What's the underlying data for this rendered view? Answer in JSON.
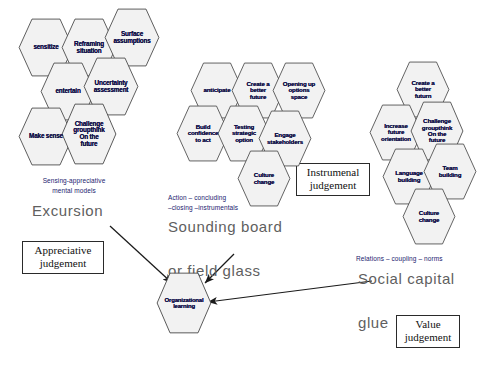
{
  "diagram": {
    "colors": {
      "hex_fill": "#f2f2f2",
      "hex_stroke": "#4a4a4a",
      "hex_text": "#13124a",
      "caption_small": "#1a1a6e",
      "caption_big": "#5f5f5f",
      "box_border": "#2a2a2a",
      "arrow": "#1a1a1a"
    }
  },
  "clusters": [
    {
      "id": "sensing",
      "caption_small": "Sensing-appreciative\nmental models",
      "caption_big": "Excursion",
      "judgement_box": "Appreciative\njudgement",
      "hexes": [
        {
          "label": "sensitize"
        },
        {
          "label": "Reframing\nsituation"
        },
        {
          "label": "Surface\nassumptions"
        },
        {
          "label": "entertain"
        },
        {
          "label": "Uncertainty\nassessment"
        },
        {
          "label": "Make sense"
        },
        {
          "label": "Challenge\ngroupthink\nOn the\nfuture"
        }
      ]
    },
    {
      "id": "action",
      "caption_small": "Action  –  concluding\n–closing  –instrumentals",
      "caption_big": "Sounding  board\n\nor  field  glass",
      "judgement_box": "Instrumenal\njudgement",
      "hexes": [
        {
          "label": "anticipate"
        },
        {
          "label": "Create a\nbetter\nfuture"
        },
        {
          "label": "Opening up\noptions\nspace"
        },
        {
          "label": "Build\nconfidence\nto act"
        },
        {
          "label": "Testing\nstrategic\noption"
        },
        {
          "label": "Engage\nstakeholders"
        },
        {
          "label": "Culture\nchange"
        }
      ]
    },
    {
      "id": "relations",
      "caption_small": "Relations  –  coupling  –  norms",
      "caption_big": "Social  capital\n\nglue",
      "judgement_box": "Value\njudgement",
      "hexes": [
        {
          "label": "Create a\nbetter\nfuturn"
        },
        {
          "label": "Increase\nfuture\norientation"
        },
        {
          "label": "Challenge\ngroupthink\nOn the\nfuture"
        },
        {
          "label": "Language\nbuilding"
        },
        {
          "label": "Team\nbuilding"
        },
        {
          "label": "Culture\nchange"
        }
      ]
    }
  ],
  "center_node": {
    "label": "Organizational\nlearning"
  }
}
